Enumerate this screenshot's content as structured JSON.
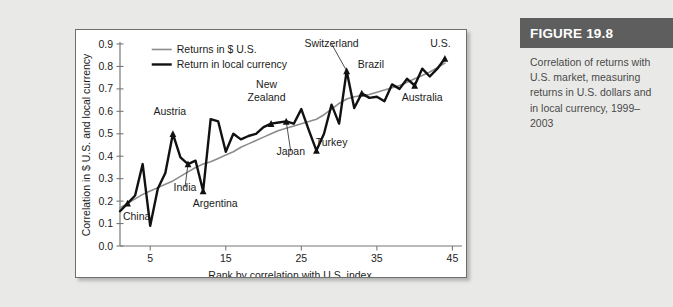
{
  "figure": {
    "header": "FIGURE 19.8",
    "caption": "Correlation of returns with U.S. market, measuring returns in U.S. dollars and in local currency, 1999–2003",
    "header_bg": "#5e5e5e",
    "caption_color": "#4a4a4a"
  },
  "chart_data": {
    "type": "line",
    "title": "",
    "xlabel": "Rank by correlation with U.S. index",
    "ylabel": "Correlation in $ U.S. and local currency",
    "xlim": [
      1,
      46
    ],
    "ylim": [
      0.0,
      0.9
    ],
    "xticks": [
      5,
      15,
      25,
      35,
      45
    ],
    "yticks": [
      "0.0",
      "0.1",
      "0.2",
      "0.3",
      "0.4",
      "0.5",
      "0.6",
      "0.7",
      "0.8",
      "0.9"
    ],
    "grid": false,
    "legend_position": "top-left",
    "series": [
      {
        "name": "Returns in $ U.S.",
        "color": "#8c8c8c",
        "width": 1.6,
        "x": [
          1,
          2,
          3,
          4,
          5,
          6,
          7,
          8,
          9,
          10,
          11,
          12,
          13,
          14,
          15,
          16,
          17,
          18,
          19,
          20,
          21,
          22,
          23,
          24,
          25,
          26,
          27,
          28,
          29,
          30,
          31,
          32,
          33,
          34,
          35,
          36,
          37,
          38,
          39,
          40,
          41,
          42,
          43,
          44
        ],
        "values": [
          0.17,
          0.19,
          0.21,
          0.23,
          0.245,
          0.26,
          0.275,
          0.29,
          0.31,
          0.33,
          0.35,
          0.365,
          0.375,
          0.39,
          0.405,
          0.42,
          0.44,
          0.455,
          0.47,
          0.485,
          0.5,
          0.515,
          0.525,
          0.535,
          0.545,
          0.555,
          0.565,
          0.585,
          0.61,
          0.635,
          0.655,
          0.665,
          0.67,
          0.675,
          0.685,
          0.695,
          0.705,
          0.715,
          0.73,
          0.745,
          0.76,
          0.775,
          0.795,
          0.815
        ]
      },
      {
        "name": "Return in local currency",
        "color": "#111111",
        "width": 2.4,
        "x": [
          1,
          2,
          3,
          4,
          5,
          6,
          7,
          8,
          9,
          10,
          11,
          12,
          13,
          14,
          15,
          16,
          17,
          18,
          19,
          20,
          21,
          22,
          23,
          24,
          25,
          26,
          27,
          28,
          29,
          30,
          31,
          32,
          33,
          34,
          35,
          36,
          37,
          38,
          39,
          40,
          41,
          42,
          43,
          44
        ],
        "values": [
          0.155,
          0.19,
          0.225,
          0.365,
          0.09,
          0.255,
          0.325,
          0.5,
          0.395,
          0.365,
          0.38,
          0.245,
          0.565,
          0.555,
          0.42,
          0.5,
          0.475,
          0.49,
          0.5,
          0.53,
          0.545,
          0.55,
          0.555,
          0.545,
          0.61,
          0.515,
          0.425,
          0.5,
          0.63,
          0.545,
          0.78,
          0.615,
          0.68,
          0.66,
          0.665,
          0.645,
          0.72,
          0.7,
          0.745,
          0.715,
          0.79,
          0.755,
          0.79,
          0.835
        ]
      }
    ],
    "annotations": [
      {
        "label": "China",
        "x": 2,
        "y": 0.19,
        "tx": 3.2,
        "ty": 0.115,
        "anchor": "middle",
        "marker": true,
        "leader": false
      },
      {
        "label": "Austria",
        "x": 8,
        "y": 0.5,
        "tx": 7.6,
        "ty": 0.585,
        "anchor": "middle",
        "marker": true,
        "leader": false
      },
      {
        "label": "India",
        "x": 10,
        "y": 0.365,
        "tx": 9.6,
        "ty": 0.245,
        "anchor": "middle",
        "marker": true,
        "leader": true
      },
      {
        "label": "Argentina",
        "x": 12,
        "y": 0.245,
        "tx": 13.6,
        "ty": 0.175,
        "anchor": "middle",
        "marker": true,
        "leader": false
      },
      {
        "label": "New",
        "x": 21,
        "y": 0.545,
        "tx": 20.4,
        "ty": 0.705,
        "anchor": "middle",
        "marker": true,
        "leader": false
      },
      {
        "label": "Zealand",
        "x": 21,
        "y": 0.545,
        "tx": 20.4,
        "ty": 0.645,
        "anchor": "middle",
        "marker": false,
        "leader": false
      },
      {
        "label": "Japan",
        "x": 23,
        "y": 0.555,
        "tx": 23.6,
        "ty": 0.405,
        "anchor": "middle",
        "marker": true,
        "leader": true
      },
      {
        "label": "Turkey",
        "x": 27,
        "y": 0.425,
        "tx": 29.0,
        "ty": 0.445,
        "anchor": "middle",
        "marker": true,
        "leader": false
      },
      {
        "label": "Switzerland",
        "x": 31,
        "y": 0.78,
        "tx": 29.0,
        "ty": 0.885,
        "anchor": "middle",
        "marker": true,
        "leader": true
      },
      {
        "label": "Brazil",
        "x": 33,
        "y": 0.68,
        "tx": 34.2,
        "ty": 0.795,
        "anchor": "middle",
        "marker": true,
        "leader": false
      },
      {
        "label": "Australia",
        "x": 40,
        "y": 0.715,
        "tx": 41.0,
        "ty": 0.645,
        "anchor": "middle",
        "marker": true,
        "leader": false
      },
      {
        "label": "U.S.",
        "x": 44,
        "y": 0.835,
        "tx": 43.4,
        "ty": 0.885,
        "anchor": "middle",
        "marker": true,
        "leader": false
      }
    ]
  }
}
